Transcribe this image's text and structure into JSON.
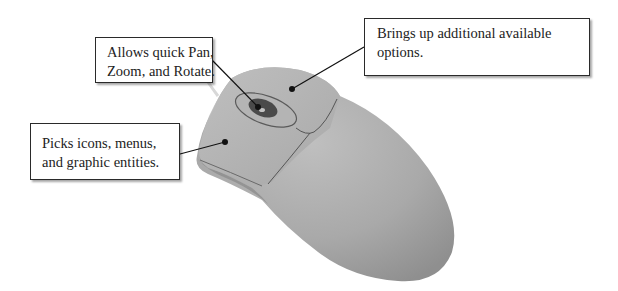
{
  "figure": {
    "callouts": {
      "scroll_wheel": {
        "lines": [
          "Allows quick Pan,",
          "Zoom, and Rotate."
        ]
      },
      "right_button": {
        "lines": [
          "Brings up additional available",
          "options."
        ]
      },
      "left_button": {
        "lines": [
          "Picks icons, menus,",
          "and graphic entities."
        ]
      }
    },
    "colors": {
      "mouse_body": "#a8a8a8",
      "mouse_shadow": "#8e8e8e",
      "mouse_highlight": "#bdbdbd",
      "wheel": "#4a4a4a",
      "leader_line": "#111111",
      "box_border": "#2a2a2a"
    }
  }
}
